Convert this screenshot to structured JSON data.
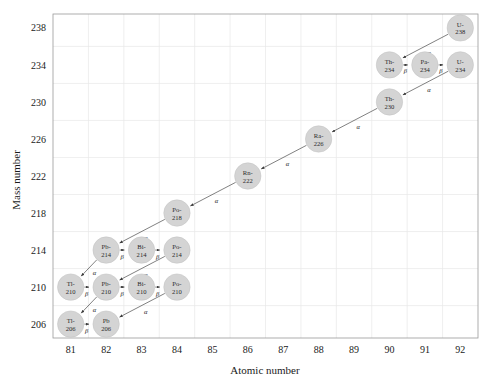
{
  "chart_data": {
    "type": "scatter",
    "title": "",
    "xlabel": "Atomic number",
    "ylabel": "Mass number",
    "xlim": [
      80.5,
      92.5
    ],
    "ylim": [
      204.5,
      239.5
    ],
    "xticks": [
      81,
      82,
      83,
      84,
      85,
      86,
      87,
      88,
      89,
      90,
      91,
      92
    ],
    "yticks": [
      206,
      210,
      214,
      218,
      222,
      226,
      230,
      234,
      238
    ],
    "grid": true,
    "legend": false,
    "node_color": "#d4d4d4",
    "line_color": "#4a4a4a",
    "nodes": [
      {
        "id": "U-238",
        "line1": "U-",
        "line2": "238",
        "z": 92,
        "a": 238
      },
      {
        "id": "Th-234",
        "line1": "Th-",
        "line2": "234",
        "z": 90,
        "a": 234
      },
      {
        "id": "Pa-234",
        "line1": "Pa-",
        "line2": "234",
        "z": 91,
        "a": 234
      },
      {
        "id": "U-234",
        "line1": "U-",
        "line2": "234",
        "z": 92,
        "a": 234
      },
      {
        "id": "Th-230",
        "line1": "Th-",
        "line2": "230",
        "z": 90,
        "a": 230
      },
      {
        "id": "Ra-226",
        "line1": "Ra-",
        "line2": "226",
        "z": 88,
        "a": 226
      },
      {
        "id": "Rn-222",
        "line1": "Rn-",
        "line2": "222",
        "z": 86,
        "a": 222
      },
      {
        "id": "Po-218",
        "line1": "Po-",
        "line2": "218",
        "z": 84,
        "a": 218
      },
      {
        "id": "Pb-214",
        "line1": "Pb-",
        "line2": "214",
        "z": 82,
        "a": 214
      },
      {
        "id": "Bi-214",
        "line1": "Bi-",
        "line2": "214",
        "z": 83,
        "a": 214
      },
      {
        "id": "Po-214",
        "line1": "Po-",
        "line2": "214",
        "z": 84,
        "a": 214
      },
      {
        "id": "Tl-210",
        "line1": "Tl-",
        "line2": "210",
        "z": 81,
        "a": 210
      },
      {
        "id": "Pb-210",
        "line1": "Pb-",
        "line2": "210",
        "z": 82,
        "a": 210
      },
      {
        "id": "Bi-210",
        "line1": "Bi-",
        "line2": "210",
        "z": 83,
        "a": 210
      },
      {
        "id": "Po-210",
        "line1": "Po-",
        "line2": "210",
        "z": 84,
        "a": 210
      },
      {
        "id": "Tl-206",
        "line1": "Tl-",
        "line2": "206",
        "z": 81,
        "a": 206
      },
      {
        "id": "Pb-206",
        "line1": "Pb",
        "line2": "206",
        "z": 82,
        "a": 206
      }
    ],
    "decays": [
      {
        "from": "U-238",
        "to": "Th-234",
        "type": "alpha",
        "label": "α"
      },
      {
        "from": "Th-234",
        "to": "Pa-234",
        "type": "beta",
        "label": "β"
      },
      {
        "from": "Pa-234",
        "to": "U-234",
        "type": "beta",
        "label": "β"
      },
      {
        "from": "U-234",
        "to": "Th-230",
        "type": "alpha",
        "label": "α"
      },
      {
        "from": "Th-230",
        "to": "Ra-226",
        "type": "alpha",
        "label": "α"
      },
      {
        "from": "Ra-226",
        "to": "Rn-222",
        "type": "alpha",
        "label": "α"
      },
      {
        "from": "Rn-222",
        "to": "Po-218",
        "type": "alpha",
        "label": "α"
      },
      {
        "from": "Po-218",
        "to": "Pb-214",
        "type": "alpha",
        "label": "α"
      },
      {
        "from": "Pb-214",
        "to": "Bi-214",
        "type": "beta",
        "label": "β"
      },
      {
        "from": "Bi-214",
        "to": "Po-214",
        "type": "beta",
        "label": "β"
      },
      {
        "from": "Po-214",
        "to": "Pb-210",
        "type": "alpha",
        "label": "α"
      },
      {
        "from": "Pb-214",
        "to": "Tl-210",
        "type": "alpha",
        "label": "α"
      },
      {
        "from": "Tl-210",
        "to": "Pb-210",
        "type": "beta",
        "label": "β"
      },
      {
        "from": "Pb-210",
        "to": "Bi-210",
        "type": "beta",
        "label": "β"
      },
      {
        "from": "Bi-210",
        "to": "Po-210",
        "type": "beta",
        "label": "β"
      },
      {
        "from": "Po-210",
        "to": "Pb-206",
        "type": "alpha",
        "label": "α"
      },
      {
        "from": "Pb-210",
        "to": "Tl-206",
        "type": "alpha",
        "label": "α"
      },
      {
        "from": "Tl-206",
        "to": "Pb-206",
        "type": "beta",
        "label": "β"
      }
    ]
  }
}
